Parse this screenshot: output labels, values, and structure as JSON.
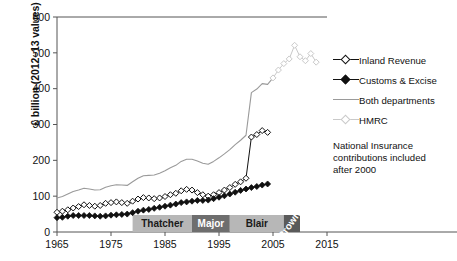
{
  "chart_data": {
    "type": "line",
    "title": "",
    "xlabel": "",
    "ylabel": "£ billion (2012–13 values)",
    "xlim": [
      1965,
      2015
    ],
    "ylim": [
      0,
      600
    ],
    "xticks": [
      1965,
      1975,
      1985,
      1995,
      2005,
      2015
    ],
    "yticks": [
      0,
      100,
      200,
      300,
      400,
      500,
      600
    ],
    "grid": false,
    "legend_position": "right",
    "annotations": [
      "National Insurance contributions included after 2000"
    ],
    "series": [
      {
        "name": "Inland Revenue",
        "marker": "open-diamond",
        "color": "#111111",
        "x": [
          1965,
          1966,
          1967,
          1968,
          1969,
          1970,
          1971,
          1972,
          1973,
          1974,
          1975,
          1976,
          1977,
          1978,
          1979,
          1980,
          1981,
          1982,
          1983,
          1984,
          1985,
          1986,
          1987,
          1988,
          1989,
          1990,
          1991,
          1992,
          1993,
          1994,
          1995,
          1996,
          1997,
          1998,
          1999,
          2000,
          2001,
          2002,
          2003,
          2004
        ],
        "values": [
          55,
          58,
          62,
          67,
          71,
          76,
          74,
          72,
          74,
          80,
          82,
          84,
          82,
          80,
          86,
          92,
          96,
          95,
          93,
          95,
          99,
          104,
          108,
          115,
          119,
          117,
          110,
          104,
          100,
          104,
          110,
          117,
          124,
          133,
          140,
          150,
          265,
          272,
          283,
          278
        ]
      },
      {
        "name": "Customs & Excise",
        "marker": "filled-diamond",
        "color": "#111111",
        "x": [
          1965,
          1966,
          1967,
          1968,
          1969,
          1970,
          1971,
          1972,
          1973,
          1974,
          1975,
          1976,
          1977,
          1978,
          1979,
          1980,
          1981,
          1982,
          1983,
          1984,
          1985,
          1986,
          1987,
          1988,
          1989,
          1990,
          1991,
          1992,
          1993,
          1994,
          1995,
          1996,
          1997,
          1998,
          1999,
          2000,
          2001,
          2002,
          2003,
          2004
        ],
        "values": [
          40,
          41,
          44,
          46,
          46,
          46,
          46,
          45,
          44,
          45,
          47,
          48,
          49,
          50,
          54,
          58,
          61,
          63,
          66,
          69,
          72,
          75,
          78,
          82,
          84,
          86,
          88,
          88,
          89,
          93,
          97,
          101,
          106,
          111,
          116,
          120,
          124,
          127,
          131,
          134
        ]
      },
      {
        "name": "Both departments",
        "marker": "line",
        "color": "#9a9a9a",
        "x": [
          1965,
          1966,
          1967,
          1968,
          1969,
          1970,
          1971,
          1972,
          1973,
          1974,
          1975,
          1976,
          1977,
          1978,
          1979,
          1980,
          1981,
          1982,
          1983,
          1984,
          1985,
          1986,
          1987,
          1988,
          1989,
          1990,
          1991,
          1992,
          1993,
          1994,
          1995,
          1996,
          1997,
          1998,
          1999,
          2000,
          2001,
          2002,
          2003,
          2004,
          2005
        ],
        "values": [
          95,
          99,
          106,
          113,
          117,
          122,
          120,
          117,
          118,
          125,
          129,
          132,
          131,
          130,
          140,
          150,
          157,
          158,
          159,
          164,
          171,
          179,
          186,
          197,
          203,
          203,
          198,
          192,
          189,
          197,
          207,
          218,
          230,
          244,
          256,
          270,
          389,
          399,
          414,
          412,
          430
        ]
      },
      {
        "name": "HMRC",
        "marker": "open-diamond-light",
        "color": "#c9c9c9",
        "x": [
          2005,
          2006,
          2007,
          2008,
          2009,
          2010,
          2011,
          2012,
          2013
        ],
        "values": [
          430,
          452,
          470,
          483,
          521,
          489,
          478,
          498,
          474
        ]
      }
    ],
    "bands": [
      {
        "label": "Thatcher",
        "start": 1979,
        "end": 1990,
        "fill": "#b7b7b7",
        "text_color": "#1a1a1a"
      },
      {
        "label": "Major",
        "start": 1990,
        "end": 1997,
        "fill": "#6e6e6e",
        "text_color": "#ffffff"
      },
      {
        "label": "Blair",
        "start": 1997,
        "end": 2007,
        "fill": "#b7b7b7",
        "text_color": "#1a1a1a"
      },
      {
        "label": "Brown",
        "start": 2007,
        "end": 2010,
        "fill": "#5a5a5a",
        "text_color": "#ffffff",
        "rotated": true
      }
    ]
  },
  "legend": {
    "items": [
      {
        "label": "Inland Revenue",
        "marker": "open-diamond"
      },
      {
        "label": "Customs & Excise",
        "marker": "filled-diamond"
      },
      {
        "label": "Both departments",
        "marker": "line"
      },
      {
        "label": "HMRC",
        "marker": "open-diamond-light"
      }
    ]
  },
  "note": {
    "line1": "National Insurance",
    "line2": "contributions included",
    "line3": "after 2000"
  },
  "colors": {
    "dark": "#111111",
    "gray_line": "#9a9a9a",
    "light_gray": "#c9c9c9",
    "band_light": "#b7b7b7",
    "band_dark": "#6e6e6e",
    "band_darkest": "#5a5a5a",
    "axis": "#555555"
  }
}
